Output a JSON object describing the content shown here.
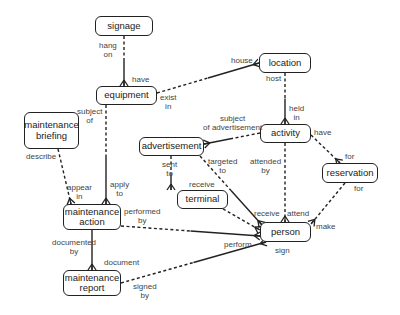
{
  "diagram": {
    "type": "entity-relationship",
    "entities": [
      {
        "id": "signage",
        "label": "signage",
        "x": 95,
        "y": 16,
        "w": 58,
        "h": 20
      },
      {
        "id": "equipment",
        "label": "equipment",
        "x": 96,
        "y": 86,
        "w": 61,
        "h": 19
      },
      {
        "id": "location",
        "label": "location",
        "x": 259,
        "y": 53,
        "w": 52,
        "h": 20
      },
      {
        "id": "activity",
        "label": "activity",
        "x": 260,
        "y": 124,
        "w": 51,
        "h": 19
      },
      {
        "id": "advertisement",
        "label": "advertisement",
        "x": 139,
        "y": 137,
        "w": 65,
        "h": 19
      },
      {
        "id": "maintenance_briefing",
        "label": "maintenance briefing",
        "x": 24,
        "y": 112,
        "w": 55,
        "h": 37
      },
      {
        "id": "reservation",
        "label": "reservation",
        "x": 322,
        "y": 163,
        "w": 56,
        "h": 20
      },
      {
        "id": "terminal",
        "label": "terminal",
        "x": 177,
        "y": 190,
        "w": 51,
        "h": 19
      },
      {
        "id": "maintenance_action",
        "label": "maintenance action",
        "x": 63,
        "y": 204,
        "w": 58,
        "h": 26
      },
      {
        "id": "person",
        "label": "person",
        "x": 260,
        "y": 222,
        "w": 51,
        "h": 20
      },
      {
        "id": "maintenance_report",
        "label": "maintenance report",
        "x": 63,
        "y": 270,
        "w": 58,
        "h": 26
      }
    ],
    "labels": [
      {
        "text": "hang\non",
        "x": 99,
        "y": 41
      },
      {
        "text": "have",
        "x": 132,
        "y": 75
      },
      {
        "text": "exist\nin",
        "x": 160,
        "y": 93
      },
      {
        "text": "house",
        "x": 231,
        "y": 56
      },
      {
        "text": "host",
        "x": 266,
        "y": 74
      },
      {
        "text": "held\nin",
        "x": 289,
        "y": 104
      },
      {
        "text": "subject\nof",
        "x": 77,
        "y": 107
      },
      {
        "text": "subject\nof advertisement",
        "x": 203,
        "y": 114
      },
      {
        "text": "have",
        "x": 314,
        "y": 128
      },
      {
        "text": "targeted\nto",
        "x": 208,
        "y": 157
      },
      {
        "text": "attended\nby",
        "x": 250,
        "y": 157
      },
      {
        "text": "for",
        "x": 345,
        "y": 152
      },
      {
        "text": "for",
        "x": 354,
        "y": 184
      },
      {
        "text": "sent\nto",
        "x": 162,
        "y": 160
      },
      {
        "text": "receive",
        "x": 189,
        "y": 180
      },
      {
        "text": "describe",
        "x": 26,
        "y": 152
      },
      {
        "text": "appear\nin",
        "x": 67,
        "y": 183
      },
      {
        "text": "apply\nto",
        "x": 110,
        "y": 180
      },
      {
        "text": "performed\nby",
        "x": 124,
        "y": 207
      },
      {
        "text": "receive",
        "x": 254,
        "y": 209
      },
      {
        "text": "attend",
        "x": 287,
        "y": 209
      },
      {
        "text": "make",
        "x": 316,
        "y": 222
      },
      {
        "text": "perform",
        "x": 224,
        "y": 240
      },
      {
        "text": "sign",
        "x": 275,
        "y": 246
      },
      {
        "text": "documented\nby",
        "x": 52,
        "y": 238
      },
      {
        "text": "document",
        "x": 104,
        "y": 258
      },
      {
        "text": "signed\nby",
        "x": 133,
        "y": 282
      }
    ],
    "edges": [
      {
        "from": "signage",
        "to": "equipment",
        "x1": 124,
        "y1": 36,
        "x2": 124,
        "y2": 86,
        "style": "half-dashed"
      },
      {
        "from": "equipment",
        "to": "location",
        "x1": 157,
        "y1": 93,
        "x2": 259,
        "y2": 63,
        "style": "half-dashed"
      },
      {
        "from": "location",
        "to": "activity",
        "x1": 285,
        "y1": 73,
        "x2": 285,
        "y2": 124,
        "style": "half-dashed"
      },
      {
        "from": "activity",
        "to": "advertisement",
        "x1": 260,
        "y1": 133,
        "x2": 204,
        "y2": 144,
        "style": "half-dashed"
      },
      {
        "from": "activity",
        "to": "reservation",
        "x1": 311,
        "y1": 135,
        "x2": 340,
        "y2": 163,
        "style": "dashed"
      },
      {
        "from": "activity",
        "to": "person",
        "x1": 285,
        "y1": 143,
        "x2": 285,
        "y2": 222,
        "style": "dashed"
      },
      {
        "from": "advertisement",
        "to": "terminal",
        "x1": 171,
        "y1": 156,
        "x2": 171,
        "y2": 190,
        "style": "half-dashed"
      },
      {
        "from": "advertisement",
        "to": "person",
        "x1": 200,
        "y1": 156,
        "x2": 262,
        "y2": 225,
        "style": "half-dashed"
      },
      {
        "from": "terminal",
        "to": "person",
        "x1": 223,
        "y1": 209,
        "x2": 260,
        "y2": 230,
        "style": "dashed"
      },
      {
        "from": "reservation",
        "to": "person",
        "x1": 345,
        "y1": 183,
        "x2": 311,
        "y2": 224,
        "style": "dashed"
      },
      {
        "from": "equipment",
        "to": "maintenance_action",
        "x1": 106,
        "y1": 105,
        "x2": 106,
        "y2": 204,
        "style": "half-dashed"
      },
      {
        "from": "maintenance_briefing",
        "to": "maintenance_action",
        "x1": 58,
        "y1": 149,
        "x2": 71,
        "y2": 204,
        "style": "dashed"
      },
      {
        "from": "maintenance_action",
        "to": "person",
        "x1": 121,
        "y1": 226,
        "x2": 260,
        "y2": 236,
        "style": "half-dashed"
      },
      {
        "from": "maintenance_action",
        "to": "maintenance_report",
        "x1": 92,
        "y1": 230,
        "x2": 92,
        "y2": 270,
        "style": "solid"
      },
      {
        "from": "maintenance_report",
        "to": "person",
        "x1": 121,
        "y1": 283,
        "x2": 266,
        "y2": 242,
        "style": "half-dashed"
      }
    ]
  }
}
